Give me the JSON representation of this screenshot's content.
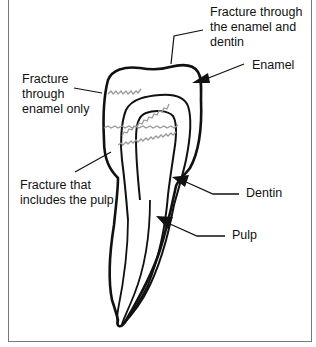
{
  "figure": {
    "labels": {
      "fracture_enamel_dentin": "Fracture through\nthe enamel and\ndentin",
      "enamel": "Enamel",
      "fracture_enamel_only": "Fracture\nthrough\nenamel only",
      "fracture_pulp": "Fracture that\nincludes the pulp",
      "dentin": "Dentin",
      "pulp": "Pulp"
    },
    "colors": {
      "outline": "#111111",
      "fracture_line": "#9a9a9a",
      "frame": "#777777"
    }
  }
}
